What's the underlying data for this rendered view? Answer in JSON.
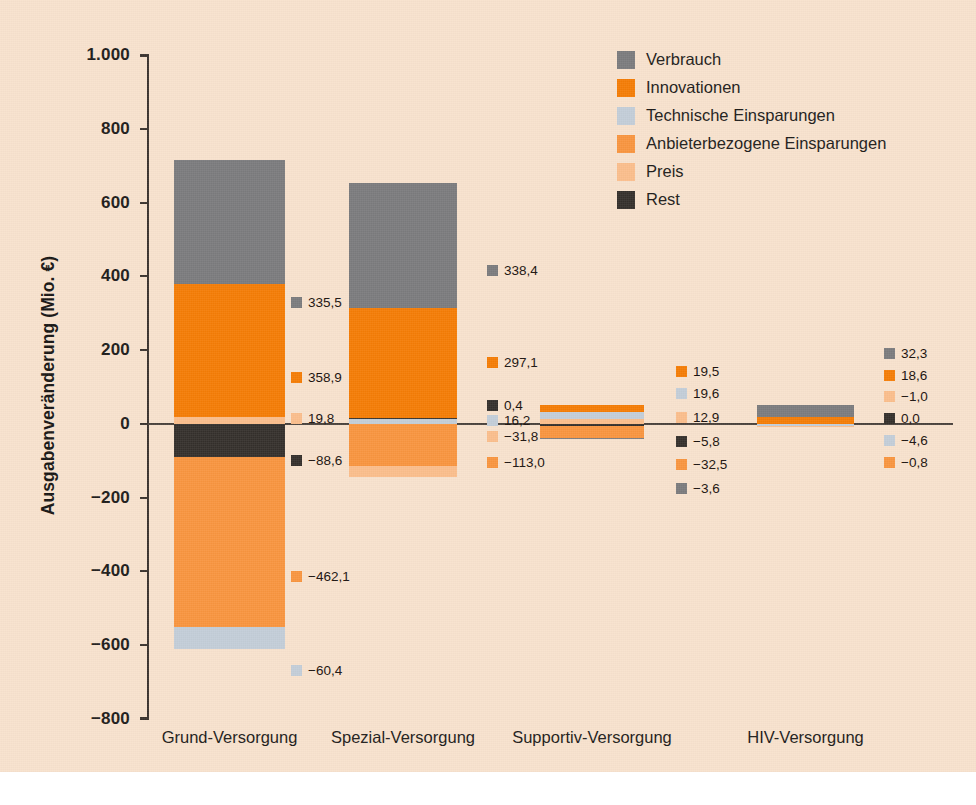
{
  "axis": {
    "y_title": "Ausgabenveränderung (Mio. €)",
    "y_ticks": [
      "1.000",
      "800",
      "600",
      "400",
      "200",
      "0",
      "−200",
      "−400",
      "−600",
      "−800"
    ]
  },
  "legend": {
    "items": [
      {
        "label": "Verbrauch",
        "color": "#7b7b7d"
      },
      {
        "label": "Innovationen",
        "color": "#f57c05"
      },
      {
        "label": "Technische Einsparungen",
        "color": "#c3cdd8"
      },
      {
        "label": "Anbieterbezogene Einsparungen",
        "color": "#f9953f"
      },
      {
        "label": "Preis",
        "color": "#fbbe8c"
      },
      {
        "label": "Rest",
        "color": "#35302c"
      }
    ]
  },
  "categories": [
    "Grund-Versorgung",
    "Spezial-Versorgung",
    "Supportiv-Versorgung",
    "HIV-Versorgung"
  ],
  "labels": {
    "g1": [
      "335,5",
      "358,9",
      "19,8",
      "−88,6",
      "−462,1",
      "−60,4"
    ],
    "g2": [
      "338,4",
      "297,1",
      "0,4",
      "16,2",
      "−31,8",
      "−113,0"
    ],
    "g3": [
      "19,5",
      "19,6",
      "12,9",
      "−5,8",
      "−32,5",
      "−3,6"
    ],
    "g4": [
      "32,3",
      "18,6",
      "−1,0",
      "0,0",
      "−4,6",
      "−0,8"
    ]
  },
  "chart_data": {
    "type": "bar",
    "subtype": "stacked-bar-diverging",
    "title": "",
    "xlabel": "",
    "ylabel": "Ausgabenveränderung (Mio. €)",
    "ylim": [
      -800,
      1000
    ],
    "ytick_step": 200,
    "grid": false,
    "legend_position": "top-right",
    "categories": [
      "Grund-Versorgung",
      "Spezial-Versorgung",
      "Supportiv-Versorgung",
      "HIV-Versorgung"
    ],
    "series": [
      {
        "name": "Verbrauch",
        "color": "#7b7b7d",
        "values": [
          335.5,
          338.4,
          -3.6,
          32.3
        ]
      },
      {
        "name": "Innovationen",
        "color": "#f57c05",
        "values": [
          358.9,
          297.1,
          19.5,
          18.6
        ]
      },
      {
        "name": "Technische Einsparungen",
        "color": "#c3cdd8",
        "values": [
          -60.4,
          16.2,
          19.6,
          -4.6
        ]
      },
      {
        "name": "Anbieterbezogene Einsparungen",
        "color": "#f9953f",
        "values": [
          -462.1,
          -113.0,
          -32.5,
          -0.8
        ]
      },
      {
        "name": "Preis",
        "color": "#fbbe8c",
        "values": [
          19.8,
          -31.8,
          12.9,
          -1.0
        ]
      },
      {
        "name": "Rest",
        "color": "#35302c",
        "values": [
          -88.6,
          0.4,
          -5.8,
          0.0
        ]
      }
    ],
    "totals_positive": [
      714.2,
      651.7,
      52.0,
      50.9
    ],
    "totals_negative": [
      -611.1,
      -144.8,
      -41.9,
      -6.4
    ]
  }
}
